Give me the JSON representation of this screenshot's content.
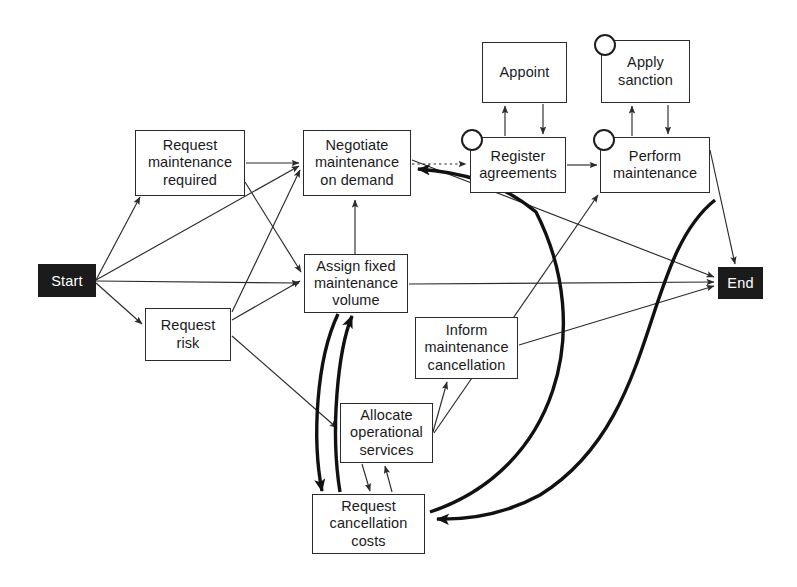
{
  "diagram": {
    "canvas": {
      "width": 797,
      "height": 587,
      "background": "#ffffff"
    },
    "colors": {
      "line": "#2b2b2b",
      "thick_line": "#111111",
      "box_fill": "#ffffff",
      "box_border": "#2b2b2b",
      "terminal_fill": "#1b1b1b",
      "terminal_text": "#ffffff"
    },
    "nodes": [
      {
        "id": "start",
        "label": "Start",
        "type": "terminal",
        "x": 38,
        "y": 264,
        "w": 58,
        "h": 33
      },
      {
        "id": "end",
        "label": "End",
        "type": "terminal",
        "x": 718,
        "y": 267,
        "w": 45,
        "h": 32
      },
      {
        "id": "req_maint",
        "label": "Request\nmaintenance\nrequired",
        "type": "task",
        "x": 135,
        "y": 130,
        "w": 110,
        "h": 66
      },
      {
        "id": "req_risk",
        "label": "Request\nrisk",
        "type": "task",
        "x": 145,
        "y": 308,
        "w": 86,
        "h": 53
      },
      {
        "id": "negotiate",
        "label": "Negotiate\nmaintenance\non demand",
        "type": "task",
        "x": 303,
        "y": 130,
        "w": 108,
        "h": 66
      },
      {
        "id": "assign",
        "label": "Assign fixed\nmaintenance\nvolume",
        "type": "task",
        "x": 304,
        "y": 254,
        "w": 104,
        "h": 59
      },
      {
        "id": "inform",
        "label": "Inform\nmaintenance\ncancellation",
        "type": "task",
        "x": 415,
        "y": 317,
        "w": 103,
        "h": 62
      },
      {
        "id": "allocate",
        "label": "Allocate\noperational\nservices",
        "type": "task",
        "x": 340,
        "y": 403,
        "w": 93,
        "h": 60
      },
      {
        "id": "req_cancel",
        "label": "Request\ncancellation\ncosts",
        "type": "task",
        "x": 312,
        "y": 494,
        "w": 113,
        "h": 60
      },
      {
        "id": "appoint",
        "label": "Appoint",
        "type": "task",
        "x": 482,
        "y": 42,
        "w": 85,
        "h": 61
      },
      {
        "id": "sanction",
        "label": "Apply\nsanction",
        "type": "task",
        "x": 601,
        "y": 40,
        "w": 89,
        "h": 63
      },
      {
        "id": "register",
        "label": "Register\nagreements",
        "type": "task",
        "x": 470,
        "y": 137,
        "w": 96,
        "h": 56
      },
      {
        "id": "perform",
        "label": "Perform\nmaintenance",
        "type": "task",
        "x": 600,
        "y": 137,
        "w": 110,
        "h": 56
      }
    ],
    "role_circles": [
      {
        "id": "circle-register",
        "attached_to": "register",
        "cx": 472,
        "cy": 140
      },
      {
        "id": "circle-perform",
        "attached_to": "perform",
        "cx": 604,
        "cy": 140
      },
      {
        "id": "circle-sanction",
        "attached_to": "sanction",
        "cx": 605,
        "cy": 45
      }
    ],
    "edges": [
      {
        "id": "start-req_maint",
        "from": "start",
        "to": "req_maint",
        "style": "thin"
      },
      {
        "id": "start-negotiate",
        "from": "start",
        "to": "negotiate",
        "style": "thin"
      },
      {
        "id": "start-assign",
        "from": "start",
        "to": "assign",
        "style": "thin"
      },
      {
        "id": "start-req_risk",
        "from": "start",
        "to": "req_risk",
        "style": "thin"
      },
      {
        "id": "req_maint-negotiate",
        "from": "req_maint",
        "to": "negotiate",
        "style": "thin"
      },
      {
        "id": "req_maint-assign",
        "from": "req_maint",
        "to": "assign",
        "style": "thin"
      },
      {
        "id": "req_risk-negotiate",
        "from": "req_risk",
        "to": "negotiate",
        "style": "thin"
      },
      {
        "id": "req_risk-assign",
        "from": "req_risk",
        "to": "assign",
        "style": "thin"
      },
      {
        "id": "req_risk-allocate",
        "from": "req_risk",
        "to": "allocate",
        "style": "thin"
      },
      {
        "id": "negotiate-register",
        "from": "negotiate",
        "to": "register",
        "style": "dotted"
      },
      {
        "id": "negotiate-end",
        "from": "negotiate",
        "to": "end",
        "style": "thin"
      },
      {
        "id": "assign-negotiate",
        "from": "assign",
        "to": "negotiate",
        "style": "thin"
      },
      {
        "id": "assign-end",
        "from": "assign",
        "to": "end",
        "style": "thin"
      },
      {
        "id": "assign-req_cancel",
        "from": "assign",
        "to": "req_cancel",
        "style": "thick"
      },
      {
        "id": "req_cancel-assign",
        "from": "req_cancel",
        "to": "assign",
        "style": "thick"
      },
      {
        "id": "allocate-inform",
        "from": "allocate",
        "to": "inform",
        "style": "thin"
      },
      {
        "id": "allocate-req_cancel",
        "from": "allocate",
        "to": "req_cancel",
        "style": "thin"
      },
      {
        "id": "req_cancel-allocate",
        "from": "req_cancel",
        "to": "allocate",
        "style": "thin"
      },
      {
        "id": "inform-end",
        "from": "inform",
        "to": "end",
        "style": "thin"
      },
      {
        "id": "allocate-perform",
        "from": "allocate",
        "to": "perform",
        "style": "thin"
      },
      {
        "id": "register-appoint",
        "from": "register",
        "to": "appoint",
        "style": "thin"
      },
      {
        "id": "appoint-register",
        "from": "appoint",
        "to": "register",
        "style": "thin"
      },
      {
        "id": "register-perform",
        "from": "register",
        "to": "perform",
        "style": "thin"
      },
      {
        "id": "perform-sanction",
        "from": "perform",
        "to": "sanction",
        "style": "thin"
      },
      {
        "id": "sanction-perform",
        "from": "sanction",
        "to": "perform",
        "style": "thin"
      },
      {
        "id": "perform-end",
        "from": "perform",
        "to": "end",
        "style": "thin"
      },
      {
        "id": "req_cancel-negotiate",
        "from": "req_cancel",
        "to": "negotiate",
        "style": "thick-curve"
      },
      {
        "id": "right-req_cancel",
        "from": "perform",
        "to": "req_cancel",
        "style": "thick-curve"
      }
    ]
  }
}
